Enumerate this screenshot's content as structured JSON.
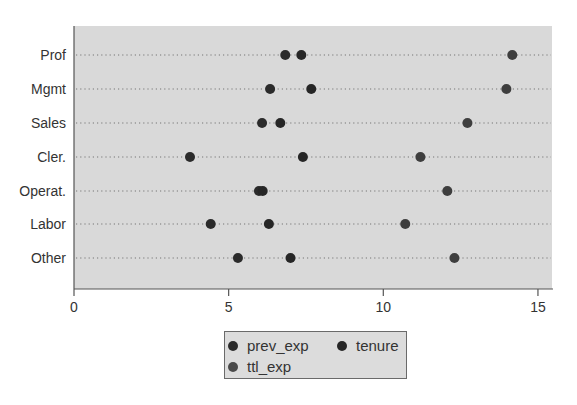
{
  "chart_data": {
    "type": "scatter",
    "subtype": "dot-plot",
    "title": "",
    "xlabel": "",
    "ylabel": "",
    "xlim": [
      0,
      15.4
    ],
    "xticks": [
      0,
      5,
      10,
      15
    ],
    "xtick_labels": [
      "0",
      "5",
      "10",
      "15"
    ],
    "grid": "dotted horizontal lines per category",
    "legend_position": "bottom",
    "categories": [
      "Prof",
      "Mgmt",
      "Sales",
      "Cler.",
      "Operat.",
      "Labor",
      "Other"
    ],
    "series": [
      {
        "name": "prev_exp",
        "color": "#2b2b2b",
        "values": [
          6.83,
          6.34,
          6.08,
          3.75,
          5.98,
          4.42,
          5.3
        ]
      },
      {
        "name": "tenure",
        "color": "#262626",
        "values": [
          7.35,
          7.67,
          6.67,
          7.4,
          6.1,
          6.3,
          7.0
        ]
      },
      {
        "name": "ttl_exp",
        "color": "#3e3e3e",
        "values": [
          14.17,
          13.98,
          12.72,
          11.2,
          12.07,
          10.71,
          12.3
        ]
      }
    ]
  },
  "legend": {
    "items": [
      {
        "label": "prev_exp",
        "color": "#2b2b2b"
      },
      {
        "label": "tenure",
        "color": "#262626"
      },
      {
        "label": "ttl_exp",
        "color": "#4a4a4a"
      }
    ]
  },
  "style": {
    "plot_bg": "#d9d9d9",
    "axis_color": "#555555",
    "grid_color": "#7a7a7a",
    "text_color": "#333333"
  }
}
